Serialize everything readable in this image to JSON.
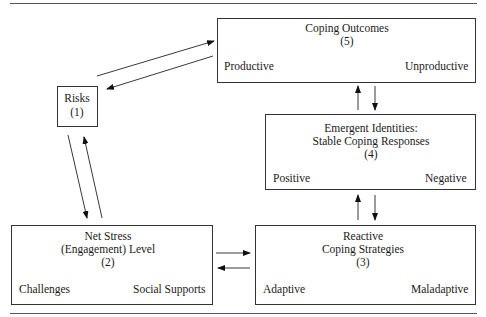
{
  "diagram": {
    "nodes": {
      "risks": {
        "title": "Risks",
        "number": "(1)"
      },
      "net_stress": {
        "title_line1": "Net Stress",
        "title_line2": "(Engagement) Level",
        "number": "(2)",
        "left_branch": "Challenges",
        "right_branch": "Social Supports"
      },
      "reactive": {
        "title_line1": "Reactive",
        "title_line2": "Coping Strategies",
        "number": "(3)",
        "left_branch": "Adaptive",
        "right_branch": "Maladaptive"
      },
      "emergent": {
        "title_line1": "Emergent Identities:",
        "title_line2": "Stable Coping Responses",
        "number": "(4)",
        "left_branch": "Positive",
        "right_branch": "Negative"
      },
      "outcomes": {
        "title_line1": "Coping Outcomes",
        "number": "(5)",
        "left_branch": "Productive",
        "right_branch": "Unproductive"
      }
    },
    "edges": [
      {
        "from": "risks",
        "to": "outcomes",
        "bidirectional": true
      },
      {
        "from": "risks",
        "to": "net_stress",
        "bidirectional": true
      },
      {
        "from": "net_stress",
        "to": "reactive",
        "bidirectional": true
      },
      {
        "from": "reactive",
        "to": "emergent",
        "bidirectional": true
      },
      {
        "from": "emergent",
        "to": "outcomes",
        "bidirectional": true
      }
    ]
  }
}
